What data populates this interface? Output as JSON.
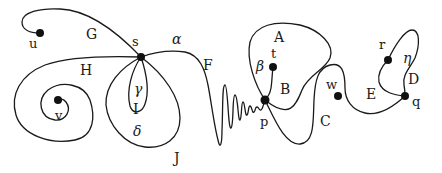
{
  "diagram": {
    "type": "topological curves / arcs diagram",
    "stroke_color": "#1a1a1a",
    "background": "#ffffff",
    "points": [
      {
        "id": "u",
        "label": "u"
      },
      {
        "id": "s",
        "label": "s"
      },
      {
        "id": "v",
        "label": "v"
      },
      {
        "id": "t",
        "label": "t"
      },
      {
        "id": "p",
        "label": "p"
      },
      {
        "id": "w",
        "label": "w"
      },
      {
        "id": "r",
        "label": "r"
      },
      {
        "id": "q",
        "label": "q"
      }
    ],
    "curve_labels": {
      "G": "G",
      "H": "H",
      "I": "I",
      "J": "J",
      "F": "F",
      "A": "A",
      "B": "B",
      "C": "C",
      "D": "D",
      "E": "E"
    },
    "region_labels": {
      "alpha": "α",
      "beta": "β",
      "gamma": "γ",
      "delta": "δ",
      "eta": "η"
    }
  }
}
